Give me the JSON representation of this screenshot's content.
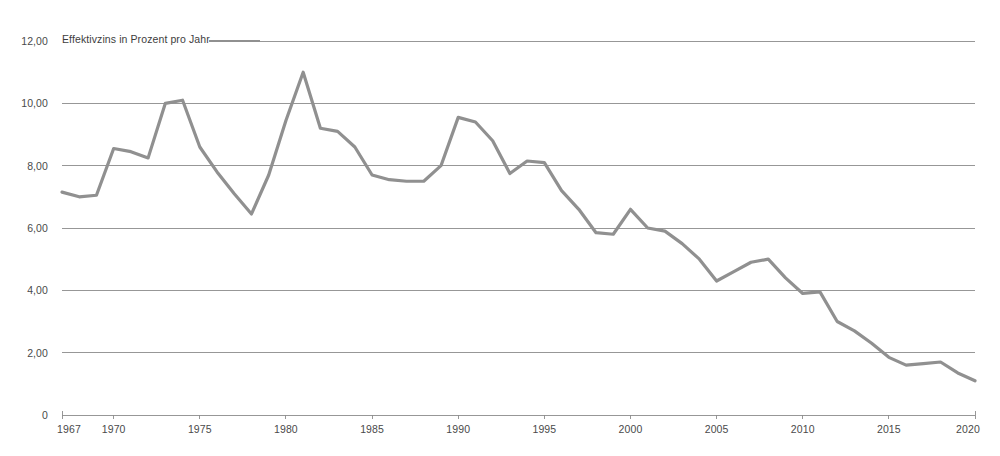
{
  "chart_data": {
    "type": "line",
    "title": "",
    "subtitle": "",
    "series_label": "Effektivzins in Prozent pro Jahr",
    "xlabel": "",
    "ylabel": "Effektivzins in Prozent pro Jahr",
    "xlim": [
      1967,
      2020
    ],
    "ylim": [
      0,
      12
    ],
    "grid": true,
    "legend_position": "top-left-inline",
    "line_color": "#909090",
    "gridline_color": "#8c8c8c",
    "axis_color": "#8c8c8c",
    "background_color": "#ffffff",
    "y_ticks": [
      0,
      2,
      4,
      6,
      8,
      10,
      12
    ],
    "y_tick_labels": [
      "0",
      "2,00",
      "4,00",
      "6,00",
      "8,00",
      "10,00",
      "12,00"
    ],
    "x_ticks": [
      1967,
      1970,
      1975,
      1980,
      1985,
      1990,
      1995,
      2000,
      2005,
      2010,
      2015,
      2020
    ],
    "x_tick_labels": [
      "1967",
      "1970",
      "1975",
      "1980",
      "1985",
      "1990",
      "1995",
      "2000",
      "2005",
      "2010",
      "2015",
      "2020"
    ],
    "x": [
      1967,
      1968,
      1969,
      1970,
      1971,
      1972,
      1973,
      1974,
      1975,
      1976,
      1977,
      1978,
      1979,
      1980,
      1981,
      1982,
      1983,
      1984,
      1985,
      1986,
      1987,
      1988,
      1989,
      1990,
      1991,
      1992,
      1993,
      1994,
      1995,
      1996,
      1997,
      1998,
      1999,
      2000,
      2001,
      2002,
      2003,
      2004,
      2005,
      2006,
      2007,
      2008,
      2009,
      2010,
      2011,
      2012,
      2013,
      2014,
      2015,
      2016,
      2017,
      2018,
      2019,
      2020
    ],
    "values": [
      7.15,
      7.0,
      7.05,
      8.55,
      8.45,
      8.25,
      10.0,
      10.1,
      8.6,
      7.8,
      7.1,
      6.45,
      7.7,
      9.45,
      11.0,
      9.2,
      9.1,
      8.6,
      7.7,
      7.55,
      7.5,
      7.5,
      8.0,
      9.55,
      9.4,
      8.8,
      7.75,
      8.15,
      8.1,
      7.2,
      6.6,
      5.85,
      5.8,
      6.6,
      6.0,
      5.9,
      5.5,
      5.0,
      4.3,
      4.6,
      4.9,
      5.0,
      4.4,
      3.9,
      3.95,
      3.0,
      2.7,
      2.3,
      1.85,
      1.6,
      1.65,
      1.7,
      1.35,
      1.1
    ],
    "series": [
      {
        "name": "Effektivzins in Prozent pro Jahr",
        "values": [
          7.15,
          7.0,
          7.05,
          8.55,
          8.45,
          8.25,
          10.0,
          10.1,
          8.6,
          7.8,
          7.1,
          6.45,
          7.7,
          9.45,
          11.0,
          9.2,
          9.1,
          8.6,
          7.7,
          7.55,
          7.5,
          7.5,
          8.0,
          9.55,
          9.4,
          8.8,
          7.75,
          8.15,
          8.1,
          7.2,
          6.6,
          5.85,
          5.8,
          6.6,
          6.0,
          5.9,
          5.5,
          5.0,
          4.3,
          4.6,
          4.9,
          5.0,
          4.4,
          3.9,
          3.95,
          3.0,
          2.7,
          2.3,
          1.85,
          1.6,
          1.65,
          1.7,
          1.35,
          1.1
        ]
      }
    ]
  },
  "footnote": {
    "text": ""
  }
}
